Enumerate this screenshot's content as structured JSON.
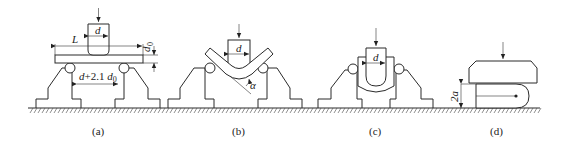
{
  "figure": {
    "panels": [
      {
        "id": "a",
        "caption": "(a)",
        "labels": {
          "span_length": "L",
          "mandrel_diameter": "d",
          "thickness": "d",
          "thickness_sub": "0",
          "support_spacing_prefix": "d",
          "support_spacing_mid": "+2.1 ",
          "support_spacing_var": "d",
          "support_spacing_sub": "0"
        }
      },
      {
        "id": "b",
        "caption": "(b)",
        "labels": {
          "mandrel_diameter": "d",
          "bend_angle": "α"
        }
      },
      {
        "id": "c",
        "caption": "(c)",
        "labels": {
          "mandrel_diameter": "d"
        }
      },
      {
        "id": "d",
        "caption": "(d)",
        "labels": {
          "gap_height": "2a"
        }
      }
    ]
  }
}
